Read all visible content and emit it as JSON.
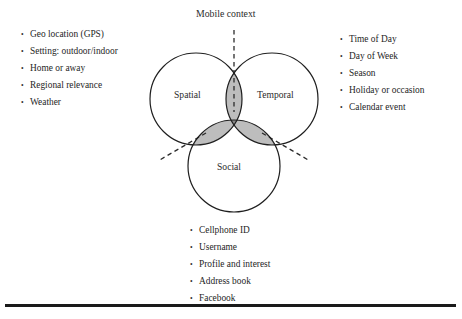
{
  "figure": {
    "title_label": "Mobile context",
    "circles": [
      {
        "key": "spatial",
        "label": "Spatial",
        "cx": 196,
        "cy": 99,
        "r": 46
      },
      {
        "key": "temporal",
        "label": "Temporal",
        "cx": 272,
        "cy": 99,
        "r": 46
      },
      {
        "key": "social",
        "label": "Social",
        "cx": 234,
        "cy": 166,
        "r": 46
      }
    ],
    "colors": {
      "stroke": "#1f1f1f",
      "pair_intersection_fill": "#bdbdbd",
      "triple_intersection_fill": "#8a8a8a",
      "circle_fill": "#ffffff",
      "text": "#262626",
      "rule": "#1a1a1a"
    },
    "leader_lines": [
      {
        "name": "top-leader",
        "style": "dashed",
        "from": [
          234,
          30
        ],
        "to": [
          234,
          112
        ]
      },
      {
        "name": "left-leader",
        "style": "dashed",
        "from": [
          205,
          134
        ],
        "to": [
          158,
          160
        ]
      },
      {
        "name": "right-leader",
        "style": "dashed",
        "from": [
          263,
          134
        ],
        "to": [
          310,
          160
        ]
      }
    ]
  },
  "lists": {
    "spatial": {
      "items": [
        "Geo location (GPS)",
        "Setting: outdoor/indoor",
        "Home or away",
        "Regional relevance",
        "Weather"
      ]
    },
    "temporal": {
      "items": [
        "Time of Day",
        "Day of Week",
        "Season",
        "Holiday or occasion",
        "Calendar event"
      ]
    },
    "social": {
      "items": [
        "Cellphone ID",
        "Username",
        "Profile and interest",
        "Address book",
        "Facebook"
      ]
    }
  }
}
